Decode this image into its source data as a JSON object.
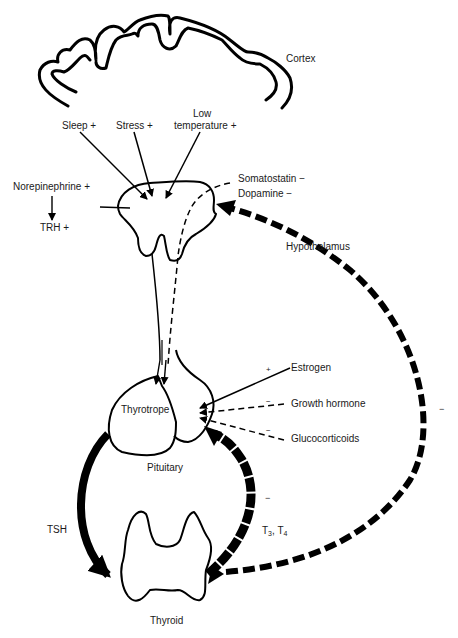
{
  "diagram": {
    "type": "hypothalamic-pituitary-thyroid axis",
    "structures": {
      "cortex": "Cortex",
      "hypothalamus": "Hypothalamus",
      "thyrotrope": "Thyrotrope",
      "pituitary": "Pituitary",
      "thyroid": "Thyroid"
    },
    "stimuli": {
      "sleep": "Sleep +",
      "stress": "Stress +",
      "low_temp_line1": "Low",
      "low_temp_line2": "temperature +",
      "norepinephrine": "Norepinephrine +",
      "trh": "TRH +",
      "somatostatin": "Somatostatin −",
      "dopamine": "Dopamine −"
    },
    "pituitary_modulators": {
      "estrogen": "Estrogen",
      "estrogen_sign": "+",
      "growth_hormone": "Growth hormone",
      "growth_hormone_sign": "−",
      "glucocorticoids": "Glucocorticoids",
      "glucocorticoids_sign": "−"
    },
    "hormones": {
      "tsh": "TSH",
      "t3": "T",
      "t3_sub": "3",
      "sep": ", ",
      "t4": "T",
      "t4_sub": "4",
      "feedback_pituitary_sign": "−",
      "feedback_hypothalamus_sign": "−"
    },
    "colors": {
      "ink": "#000000",
      "text": "#1a1a1a",
      "background": "#ffffff"
    }
  }
}
